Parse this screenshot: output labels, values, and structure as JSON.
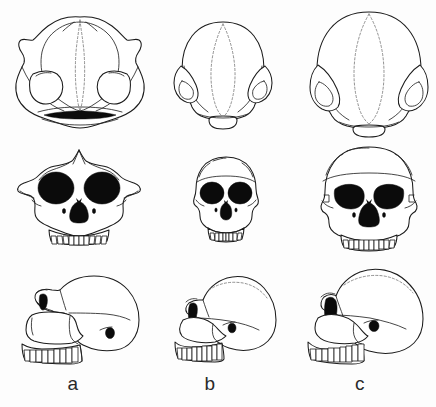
{
  "figure": {
    "background_color": "#fdfdfd",
    "line_color": "#1b1b1b",
    "suture_color": "#6e6e6e",
    "fill_color": "#0b0b0b",
    "width": 436,
    "height": 407,
    "columns": [
      {
        "key": "a",
        "label": "a",
        "description": "Large robust skull with pronounced sagittal crest, flaring zygomatic arches, large orbits and prognathic face"
      },
      {
        "key": "b",
        "label": "b",
        "description": "Small gracile skull with rounded braincase, modest brow ridge, small orbits and reduced dentition"
      },
      {
        "key": "c",
        "label": "c",
        "description": "Large rounded braincase with heavy continuous brow ridge, broad orbits and wide nasal aperture"
      }
    ],
    "rows": [
      {
        "key": "superior",
        "name": "superior view"
      },
      {
        "key": "anterior",
        "name": "anterior view"
      },
      {
        "key": "lateral",
        "name": "lateral view"
      }
    ]
  }
}
